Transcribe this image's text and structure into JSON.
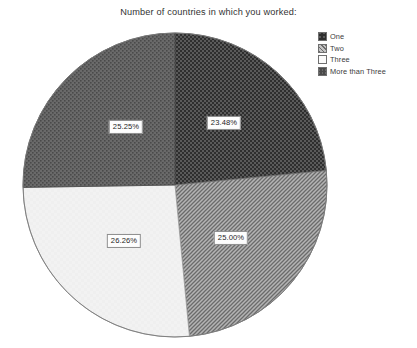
{
  "chart_data": {
    "type": "pie",
    "title": "Number of countries in which you worked:",
    "categories": [
      "One",
      "Two",
      "Three",
      "More than Three"
    ],
    "values": [
      23.48,
      25.0,
      26.26,
      25.25
    ],
    "value_labels": [
      "23.48%",
      "25.00%",
      "26.26%",
      "25.25%"
    ],
    "legend_position": "top-right",
    "grid": false,
    "xlabel": "",
    "ylabel": "",
    "start_angle_deg": 0,
    "direction": "clockwise",
    "slices": [
      {
        "label": "One",
        "value": 23.48,
        "value_label": "23.48%",
        "pattern": "dark-checkerboard",
        "base_color": "#3c3c3c",
        "label_x": 224,
        "label_y": 123
      },
      {
        "label": "Two",
        "value": 25.0,
        "value_label": "25.00%",
        "pattern": "diagonal-hatch",
        "base_color": "#8f8f8f",
        "label_x": 231,
        "label_y": 238
      },
      {
        "label": "Three",
        "value": 26.26,
        "value_label": "26.26%",
        "pattern": "solid-light",
        "base_color": "#f1f1f1",
        "label_x": 124,
        "label_y": 241
      },
      {
        "label": "More than Three",
        "value": 25.25,
        "value_label": "25.25%",
        "pattern": "fine-dots",
        "base_color": "#626262",
        "label_x": 126,
        "label_y": 127
      }
    ]
  },
  "legend": {
    "items": [
      {
        "label": "One",
        "pattern": "dark-checkerboard"
      },
      {
        "label": "Two",
        "pattern": "diagonal-hatch"
      },
      {
        "label": "Three",
        "pattern": "solid-light"
      },
      {
        "label": "More than Three",
        "pattern": "fine-dots"
      }
    ]
  }
}
